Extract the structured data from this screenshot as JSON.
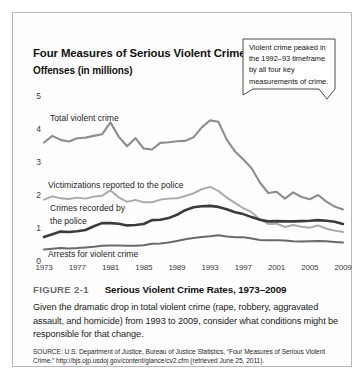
{
  "figure": {
    "number_label": "FIGURE 2-1",
    "heading": "Serious Violent Crime Rates, 1973–2009",
    "caption": "Given the dramatic drop in total violent crime (rape, robbery, aggravated assault, and homicide) from 1993 to 2009, consider what conditions might be responsible for that change.",
    "source": "SOURCE: U.S. Department of Justice, Bureau of Justice Statistics, “Four Measures of Serious Violent Crime.” http://bjs.ojp.usdoj.gov/content/glance/cv2.cfm (retrieved June 25, 2011)."
  },
  "callout": {
    "text": "Violent crime peaked in the 1992–93 timeframe by all four key measurements of crime."
  },
  "chart_data": {
    "type": "line",
    "title": "Four Measures of Serious Violent Crime",
    "subtitle": "Offenses (in millions)",
    "xlabel": "",
    "ylabel": "Offenses (in millions)",
    "xlim": [
      1973,
      2009
    ],
    "ylim": [
      0,
      5
    ],
    "yticks": [
      0,
      1,
      2,
      3,
      4,
      5
    ],
    "ytick_labels": [
      "0",
      "1",
      "2",
      "3",
      "4",
      "5"
    ],
    "xticks": [
      1973,
      1977,
      1981,
      1985,
      1989,
      1993,
      1997,
      2001,
      2005,
      2009
    ],
    "xtick_labels": [
      "1973",
      "1977",
      "1981",
      "1985",
      "1989",
      "1993",
      "1997",
      "2001",
      "2005",
      "2009"
    ],
    "grid": false,
    "legend": "inline-labels",
    "x": [
      1973,
      1974,
      1975,
      1976,
      1977,
      1978,
      1979,
      1980,
      1981,
      1982,
      1983,
      1984,
      1985,
      1986,
      1987,
      1988,
      1989,
      1990,
      1991,
      1992,
      1993,
      1994,
      1995,
      1996,
      1997,
      1998,
      1999,
      2000,
      2001,
      2002,
      2003,
      2004,
      2005,
      2006,
      2007,
      2008,
      2009
    ],
    "series": [
      {
        "name": "Total violent crime",
        "color": "#8d8d8d",
        "width": 2.1,
        "values": [
          3.59,
          3.79,
          3.67,
          3.62,
          3.72,
          3.74,
          3.79,
          3.84,
          4.2,
          3.76,
          3.48,
          3.72,
          3.41,
          3.38,
          3.58,
          3.6,
          3.63,
          3.64,
          3.75,
          4.05,
          4.26,
          4.22,
          3.68,
          3.32,
          3.08,
          2.81,
          2.38,
          2.06,
          2.1,
          1.89,
          2.08,
          1.94,
          1.87,
          2.0,
          1.8,
          1.65,
          1.56
        ]
      },
      {
        "name": "Victimizations reported to the police",
        "color": "#a9a9a9",
        "width": 1.9,
        "values": [
          1.86,
          1.96,
          1.9,
          1.88,
          1.92,
          1.89,
          1.95,
          1.98,
          2.14,
          1.93,
          1.79,
          1.85,
          1.78,
          1.78,
          1.86,
          1.89,
          1.9,
          1.97,
          2.05,
          2.18,
          2.25,
          2.12,
          1.92,
          1.76,
          1.6,
          1.48,
          1.26,
          1.12,
          1.13,
          1.03,
          1.09,
          1.04,
          1.01,
          1.08,
          0.98,
          0.92,
          0.88
        ]
      },
      {
        "name": "Crimes recorded by the police",
        "color": "#3b3b3b",
        "width": 2.6,
        "values": [
          0.73,
          0.81,
          0.89,
          0.88,
          0.9,
          0.94,
          1.05,
          1.15,
          1.15,
          1.13,
          1.08,
          1.09,
          1.12,
          1.24,
          1.25,
          1.3,
          1.4,
          1.54,
          1.63,
          1.66,
          1.67,
          1.64,
          1.57,
          1.48,
          1.42,
          1.33,
          1.25,
          1.2,
          1.21,
          1.2,
          1.2,
          1.21,
          1.22,
          1.24,
          1.22,
          1.19,
          1.12
        ]
      },
      {
        "name": "Arrests for violent crime",
        "color": "#6a6a6a",
        "width": 2.0,
        "values": [
          0.35,
          0.37,
          0.39,
          0.38,
          0.39,
          0.41,
          0.43,
          0.46,
          0.47,
          0.47,
          0.46,
          0.46,
          0.48,
          0.52,
          0.53,
          0.56,
          0.61,
          0.66,
          0.7,
          0.73,
          0.75,
          0.78,
          0.74,
          0.72,
          0.72,
          0.68,
          0.64,
          0.63,
          0.63,
          0.62,
          0.6,
          0.59,
          0.6,
          0.61,
          0.6,
          0.58,
          0.56
        ]
      }
    ],
    "annotations": [
      {
        "name": "total-violent-crime-label",
        "text": "Total violent crime"
      },
      {
        "name": "victimizations-label",
        "text": "Victimizations reported to the police"
      },
      {
        "name": "crimes-recorded-label-line1",
        "text": "Crimes recorded by"
      },
      {
        "name": "crimes-recorded-label-line2",
        "text": "the police"
      },
      {
        "name": "arrests-label",
        "text": "Arrests for violent crime"
      }
    ]
  }
}
